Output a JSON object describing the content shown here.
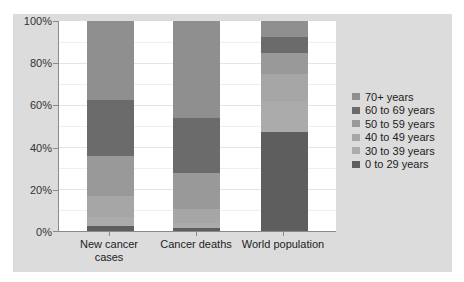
{
  "chart_data": {
    "type": "bar",
    "stacked": true,
    "normalized": true,
    "title": "",
    "xlabel": "",
    "ylabel": "",
    "ylim": [
      0,
      100
    ],
    "yticks": [
      "0%",
      "20%",
      "40%",
      "60%",
      "80%",
      "100%"
    ],
    "grid": true,
    "legend_position": "right",
    "categories": [
      "New cancer cases",
      "Cancer deaths",
      "World population"
    ],
    "series": [
      {
        "name": "0 to 29 years",
        "color": "#5e5e5e",
        "values": [
          2.5,
          1.5,
          47
        ]
      },
      {
        "name": "30 to 39 years",
        "color": "#ababab",
        "values": [
          4,
          2.5,
          15
        ]
      },
      {
        "name": "40 to 49 years",
        "color": "#a6a6a6",
        "values": [
          10,
          6.5,
          13
        ]
      },
      {
        "name": "50 to 59 years",
        "color": "#999999",
        "values": [
          19,
          17,
          10
        ]
      },
      {
        "name": "60 to 69 years",
        "color": "#6b6b6b",
        "values": [
          27,
          26.5,
          7.5
        ]
      },
      {
        "name": "70+ years",
        "color": "#8f8f8f",
        "values": [
          37.5,
          46,
          7.5
        ]
      }
    ]
  },
  "legend": {
    "items": [
      {
        "label": "70+ years",
        "color": "#8f8f8f"
      },
      {
        "label": "60 to 69 years",
        "color": "#6b6b6b"
      },
      {
        "label": "50 to 59 years",
        "color": "#999999"
      },
      {
        "label": "40 to 49 years",
        "color": "#a6a6a6"
      },
      {
        "label": "30 to 39 years",
        "color": "#ababab"
      },
      {
        "label": "0 to 29 years",
        "color": "#5e5e5e"
      }
    ]
  },
  "axis": {
    "y_labels": [
      "100%",
      "80%",
      "60%",
      "40%",
      "20%",
      "0%"
    ],
    "x_labels": [
      "New cancer cases",
      "Cancer deaths",
      "World population"
    ]
  }
}
